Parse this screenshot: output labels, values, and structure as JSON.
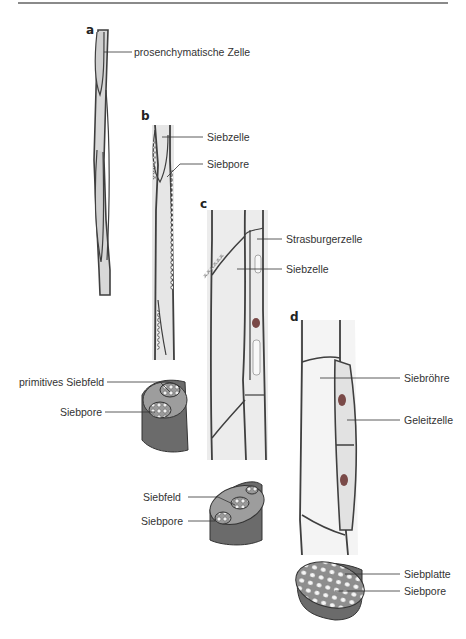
{
  "figure": {
    "panels": [
      {
        "letter": "a",
        "labels": [
          "prosenchymatische Zelle"
        ]
      },
      {
        "letter": "b",
        "labels": [
          "Siebzelle",
          "Siebpore"
        ]
      },
      {
        "letter": "c",
        "labels": [
          "Strasburgerzelle",
          "Siebzelle"
        ]
      },
      {
        "letter": "d",
        "labels": [
          "Siebröhre",
          "Geleitzelle"
        ]
      }
    ],
    "cross_sections": [
      {
        "labels": [
          "primitives Siebfeld",
          "Siebpore"
        ]
      },
      {
        "labels": [
          "Siebfeld",
          "Siebpore"
        ]
      },
      {
        "labels": [
          "Siebplatte",
          "Siebpore"
        ]
      }
    ]
  },
  "colors": {
    "wall": "#4a4a4a",
    "cytoplasm": "#d6d6d6",
    "lumen": "#f4f4f4",
    "nucleus": "#7a4a48",
    "section_body": "#6b6b6b"
  }
}
